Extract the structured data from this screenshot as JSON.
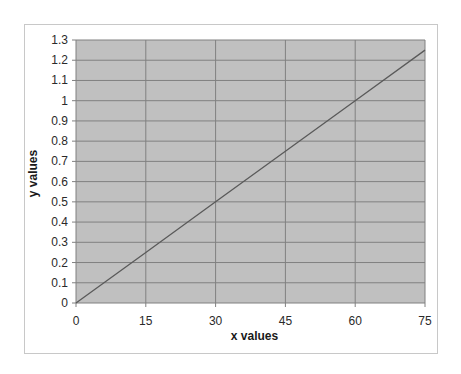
{
  "chart_data": {
    "type": "line",
    "title": "",
    "xlabel": "x values",
    "ylabel": "y values",
    "xlim": [
      0,
      75
    ],
    "ylim": [
      0,
      1.3
    ],
    "x_ticks": [
      "0",
      "15",
      "30",
      "45",
      "60",
      "75"
    ],
    "y_ticks": [
      "0",
      "0.1",
      "0.2",
      "0.3",
      "0.4",
      "0.5",
      "0.6",
      "0.7",
      "0.8",
      "0.9",
      "1",
      "1.1",
      "1.2",
      "1.3"
    ],
    "grid": true,
    "legend": null,
    "series": [
      {
        "name": "y = x/60",
        "x": [
          0,
          15,
          30,
          45,
          60,
          75
        ],
        "values": [
          0,
          0.25,
          0.5,
          0.75,
          1.0,
          1.25
        ]
      }
    ],
    "colors": {
      "plot_background": "#c0c0c0",
      "gridline": "#808080",
      "line": "#5a5a5a",
      "frame_border": "#c8c8c8"
    }
  }
}
